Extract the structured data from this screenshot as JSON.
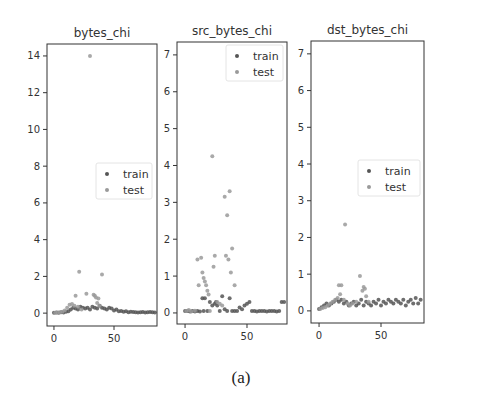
{
  "caption": "(a)",
  "legend_labels": [
    "train",
    "test"
  ],
  "colors": {
    "train": "#555555",
    "test": "#9a9a9a",
    "axis": "#333333",
    "text": "#333333"
  },
  "chart_data": [
    {
      "type": "scatter",
      "title": "bytes_chi",
      "xlabel": "",
      "ylabel": "",
      "xlim": [
        -5.8,
        85.8
      ],
      "ylim": [
        -0.7,
        14.65
      ],
      "xticks": [
        0,
        50
      ],
      "yticks": [
        0,
        2,
        4,
        6,
        8,
        10,
        12,
        14
      ],
      "grid": false,
      "legend_position": "center right",
      "series": [
        {
          "name": "train",
          "x": [
            0,
            2,
            4,
            6,
            8,
            10,
            12,
            14,
            16,
            18,
            20,
            22,
            24,
            26,
            28,
            30,
            32,
            34,
            36,
            38,
            40,
            42,
            44,
            46,
            48,
            50,
            52,
            54,
            56,
            58,
            60,
            62,
            64,
            66,
            68,
            70,
            72,
            74,
            76,
            78,
            80,
            82,
            84
          ],
          "y": [
            0.02,
            0.03,
            0.02,
            0.05,
            0.04,
            0.08,
            0.1,
            0.2,
            0.3,
            0.25,
            0.2,
            0.35,
            0.3,
            0.25,
            0.3,
            0.2,
            0.35,
            0.3,
            0.25,
            0.4,
            0.3,
            0.25,
            0.2,
            0.3,
            0.25,
            0.15,
            0.2,
            0.1,
            0.12,
            0.08,
            0.1,
            0.05,
            0.08,
            0.06,
            0.05,
            0.04,
            0.05,
            0.06,
            0.04,
            0.05,
            0.06,
            0.05,
            0.04
          ]
        },
        {
          "name": "test",
          "x": [
            1,
            3,
            5,
            7,
            9,
            11,
            13,
            15,
            17,
            18,
            20,
            21,
            23,
            27,
            30,
            33,
            34,
            35,
            36,
            37,
            38,
            40
          ],
          "y": [
            0.02,
            0.03,
            0.05,
            0.08,
            0.15,
            0.3,
            0.45,
            0.5,
            0.4,
            0.95,
            0.35,
            2.25,
            0.2,
            1.05,
            14.0,
            1.0,
            0.95,
            0.85,
            0.55,
            0.8,
            0.4,
            2.1
          ]
        }
      ]
    },
    {
      "type": "scatter",
      "title": "src_bytes_chi",
      "xlabel": "",
      "ylabel": "",
      "xlim": [
        -6.5,
        82.3
      ],
      "ylim": [
        -0.3,
        7.35
      ],
      "xticks": [
        0,
        50
      ],
      "yticks": [
        0,
        1,
        2,
        3,
        4,
        5,
        6,
        7
      ],
      "grid": false,
      "legend_position": "upper right",
      "series": [
        {
          "name": "train",
          "x": [
            0,
            2,
            4,
            6,
            8,
            10,
            12,
            14,
            15,
            16,
            18,
            20,
            22,
            24,
            25,
            26,
            28,
            30,
            32,
            34,
            36,
            38,
            40,
            42,
            44,
            46,
            48,
            50,
            52,
            54,
            56,
            58,
            60,
            62,
            64,
            66,
            68,
            70,
            72,
            74,
            76,
            78,
            80
          ],
          "y": [
            0.05,
            0.05,
            0.04,
            0.05,
            0.04,
            0.05,
            0.04,
            0.4,
            0.05,
            0.4,
            0.05,
            0.3,
            0.2,
            0.25,
            0.3,
            0.2,
            0.05,
            0.45,
            0.1,
            0.05,
            0.4,
            0.05,
            0.05,
            0.05,
            0.15,
            0.1,
            0.2,
            0.25,
            0.3,
            0.05,
            0.05,
            0.04,
            0.05,
            0.05,
            0.05,
            0.04,
            0.05,
            0.05,
            0.05,
            0.04,
            0.05,
            0.3,
            0.3
          ]
        },
        {
          "name": "test",
          "x": [
            1,
            3,
            5,
            8,
            10,
            11,
            13,
            14,
            15,
            16,
            17,
            18,
            19,
            20,
            22,
            23,
            24,
            26,
            28,
            30,
            32,
            33,
            34,
            35,
            36,
            37,
            38,
            40
          ],
          "y": [
            0.05,
            0.08,
            0.04,
            0.06,
            1.45,
            0.75,
            1.5,
            1.1,
            0.95,
            0.85,
            0.75,
            0.6,
            0.5,
            0.05,
            4.25,
            1.25,
            1.55,
            0.3,
            0.25,
            0.2,
            3.15,
            1.55,
            2.65,
            1.45,
            3.3,
            1.1,
            1.75,
            0.75
          ]
        }
      ]
    },
    {
      "type": "scatter",
      "title": "dst_bytes_chi",
      "xlabel": "",
      "ylabel": "",
      "xlim": [
        -6.5,
        84.7
      ],
      "ylim": [
        -0.33,
        7.35
      ],
      "xticks": [
        0,
        50
      ],
      "yticks": [
        0,
        1,
        2,
        3,
        4,
        5,
        6,
        7
      ],
      "grid": false,
      "legend_position": "center right",
      "series": [
        {
          "name": "train",
          "x": [
            0,
            2,
            4,
            6,
            8,
            10,
            12,
            14,
            16,
            18,
            20,
            22,
            24,
            26,
            28,
            30,
            32,
            34,
            36,
            38,
            40,
            42,
            44,
            46,
            48,
            50,
            52,
            54,
            56,
            58,
            60,
            62,
            64,
            66,
            68,
            70,
            72,
            74,
            76,
            78,
            80,
            82
          ],
          "y": [
            0.05,
            0.1,
            0.15,
            0.2,
            0.15,
            0.2,
            0.25,
            0.3,
            0.25,
            0.3,
            0.2,
            0.25,
            0.15,
            0.2,
            0.25,
            0.15,
            0.2,
            0.3,
            0.15,
            0.25,
            0.2,
            0.15,
            0.25,
            0.2,
            0.3,
            0.15,
            0.25,
            0.2,
            0.3,
            0.25,
            0.2,
            0.3,
            0.25,
            0.2,
            0.3,
            0.15,
            0.25,
            0.3,
            0.2,
            0.35,
            0.2,
            0.3
          ]
        },
        {
          "name": "test",
          "x": [
            1,
            3,
            5,
            7,
            9,
            11,
            13,
            15,
            16,
            17,
            18,
            20,
            21,
            23,
            25,
            27,
            30,
            33,
            35,
            36,
            37,
            38,
            40
          ],
          "y": [
            0.05,
            0.08,
            0.1,
            0.15,
            0.2,
            0.25,
            0.3,
            0.35,
            0.7,
            0.45,
            0.7,
            0.3,
            2.35,
            0.2,
            0.15,
            0.2,
            0.25,
            0.95,
            0.55,
            0.65,
            0.6,
            0.4,
            0.25
          ]
        }
      ]
    }
  ]
}
